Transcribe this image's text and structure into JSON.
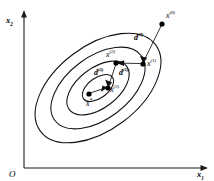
{
  "figure": {
    "title": "",
    "type": "contour-convergence-diagram",
    "background_color": "#ffffff",
    "line_color": "#111111"
  },
  "axes": {
    "x_axis": {
      "name": "x1",
      "base": "x",
      "subscript": "1"
    },
    "y_axis": {
      "name": "x2",
      "base": "x",
      "subscript": "2"
    },
    "origin": {
      "label": "O"
    }
  },
  "contours": {
    "count": 4,
    "description": "four concentric tilted ellipses representing level sets of a quadratic objective",
    "rotation_deg": -37,
    "center": {
      "cx": 98,
      "cy": 88
    },
    "rings": [
      {
        "index": 0,
        "rx": 72,
        "ry": 42
      },
      {
        "index": 1,
        "rx": 54,
        "ry": 31
      },
      {
        "index": 2,
        "rx": 36,
        "ry": 20
      },
      {
        "index": 3,
        "rx": 18,
        "ry": 10
      }
    ]
  },
  "iterates": [
    {
      "id": "x0",
      "base": "x",
      "superscript": "(0)",
      "cx": 162,
      "cy": 24,
      "label_dx": 5,
      "label_dy": -12
    },
    {
      "id": "x1",
      "base": "x",
      "superscript": "(1)",
      "cx": 143,
      "cy": 64,
      "label_dx": 5,
      "label_dy": -4
    },
    {
      "id": "x2",
      "base": "x",
      "superscript": "(2)",
      "cx": 116,
      "cy": 63,
      "label_dx": -9,
      "label_dy": -12
    },
    {
      "id": "x3",
      "base": "x",
      "superscript": "(3)",
      "cx": 108,
      "cy": 88,
      "label_dx": 3,
      "label_dy": -1
    },
    {
      "id": "xstar",
      "base": "x",
      "star": "*",
      "cx": 89,
      "cy": 94,
      "label_dx": -2,
      "label_dy": 3
    }
  ],
  "directions": [
    {
      "id": "d0",
      "base": "d",
      "superscript": "(0)",
      "from": "x0",
      "to": "x1",
      "label_x": 142,
      "label_y": 38
    },
    {
      "id": "d1",
      "base": "d",
      "superscript": "(1)",
      "from": "x1",
      "to": "x2",
      "label_x": 122,
      "label_y": 72
    },
    {
      "id": "d2",
      "base": "d",
      "superscript": "(2)",
      "from": "x2",
      "to": "x3",
      "label_x": 100,
      "label_y": 73
    }
  ],
  "labels": {
    "x0": "x",
    "x1": "x",
    "x2": "x",
    "x3": "x",
    "xstar": "x",
    "d0": "d",
    "d1": "d",
    "d2": "d",
    "sup0": "(0)",
    "sup1": "(1)",
    "sup2": "(2)",
    "sup3": "(3)",
    "star": "*",
    "axis_x": "x",
    "axis_y": "x",
    "sub1": "1",
    "sub2": "2",
    "origin": "O"
  }
}
